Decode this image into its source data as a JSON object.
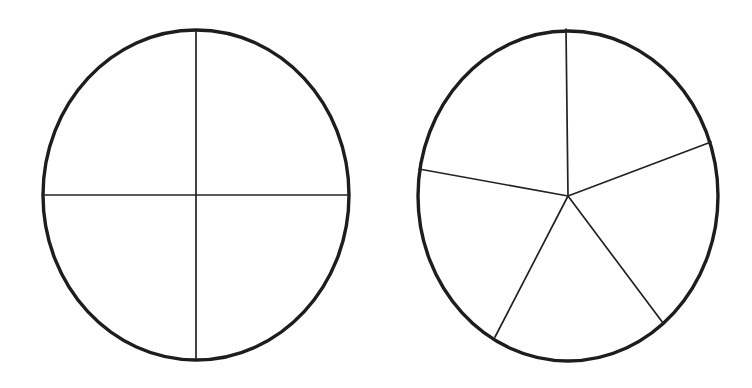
{
  "figure": {
    "background_color": "#ffffff",
    "outline_color": "#1d1d1d",
    "divider_color": "#222222",
    "outline_width": 3.4,
    "divider_width": 1.7,
    "canvas": {
      "width": 752,
      "height": 388
    },
    "shapes": [
      {
        "id": "left-circle",
        "label": "Circle divided into four equal parts",
        "fraction_label": "quarters",
        "parts": 4,
        "fraction": "1/4",
        "center": {
          "x": 196,
          "y": 195
        },
        "rx": 153,
        "ry": 165,
        "divider_angles_deg": [
          90,
          180,
          270,
          0
        ],
        "divider_endpoints": [
          {
            "name": "top",
            "x": 196,
            "y": 30
          },
          {
            "name": "left",
            "x": 43,
            "y": 195
          },
          {
            "name": "bottom",
            "x": 196,
            "y": 360
          },
          {
            "name": "right",
            "x": 349,
            "y": 195
          }
        ]
      },
      {
        "id": "right-circle",
        "label": "Circle divided into five equal parts",
        "fraction_label": "fifths",
        "parts": 5,
        "fraction": "1/5",
        "center": {
          "x": 568,
          "y": 196
        },
        "rx": 150,
        "ry": 165,
        "divider_angles_deg": [
          90,
          162,
          234,
          306,
          18
        ],
        "divider_endpoints": [
          {
            "name": "top",
            "x": 566,
            "y": 29
          },
          {
            "name": "upper-left",
            "x": 419,
            "y": 169
          },
          {
            "name": "lower-left",
            "x": 495,
            "y": 337
          },
          {
            "name": "lower-right",
            "x": 663,
            "y": 323
          },
          {
            "name": "upper-right",
            "x": 711,
            "y": 142
          }
        ]
      }
    ]
  }
}
